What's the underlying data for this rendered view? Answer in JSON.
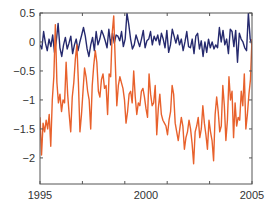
{
  "chart_data": {
    "type": "line",
    "title": "",
    "xlabel": "",
    "ylabel": "",
    "xlim": [
      1995,
      2005
    ],
    "ylim": [
      -2.45,
      0.5
    ],
    "grid": false,
    "legend": null,
    "x_ticks": [
      1995,
      1997,
      1999,
      2001,
      2003,
      2005
    ],
    "x_tick_labels": [
      "1995",
      "",
      "",
      "",
      "",
      "2005"
    ],
    "x_tick_labels_shown": [
      {
        "value": 1995,
        "label": "1995"
      },
      {
        "value": 2000,
        "label": "2000"
      },
      {
        "value": 2005,
        "label": "2005"
      }
    ],
    "y_ticks": [
      0.5,
      0,
      -0.5,
      -1,
      -1.5,
      -2
    ],
    "y_tick_labels": [
      "0.5",
      "0",
      "−0.5",
      "−1",
      "−1.5",
      "−2"
    ],
    "x_start": 1995.0,
    "x_step": 0.0833,
    "series": [
      {
        "name": "series-1",
        "color": "#262a6e",
        "values": [
          -0.05,
          -0.12,
          0.18,
          -0.02,
          -0.15,
          0.05,
          -0.08,
          0.12,
          -0.18,
          0.02,
          0.32,
          -0.1,
          -0.25,
          -0.05,
          0.08,
          -0.12,
          -0.02,
          0.1,
          -0.2,
          -0.05,
          0.05,
          -0.15,
          0.0,
          0.12,
          0.25,
          0.1,
          -0.12,
          -0.25,
          -0.05,
          0.08,
          -0.15,
          0.18,
          -0.05,
          0.05,
          0.2,
          0.12,
          0.02,
          -0.1,
          0.22,
          -0.05,
          0.15,
          -0.02,
          0.12,
          0.1,
          0.02,
          0.18,
          -0.08,
          0.05,
          0.5,
          0.3,
          0.05,
          -0.12,
          -0.05,
          0.12,
          0.02,
          -0.08,
          0.05,
          0.2,
          -0.1,
          0.02,
          0.05,
          0.18,
          -0.05,
          0.1,
          0.02,
          0.12,
          -0.05,
          0.15,
          0.05,
          -0.1,
          0.2,
          -0.18,
          -0.05,
          0.22,
          0.1,
          -0.02,
          0.12,
          -0.05,
          0.05,
          -0.15,
          0.0,
          0.18,
          -0.08,
          -0.1,
          0.05,
          -0.2,
          0.1,
          0.15,
          -0.12,
          0.02,
          -0.25,
          0.0,
          -0.18,
          0.05,
          -0.1,
          0.0,
          -0.12,
          -0.05,
          -0.1,
          0.25,
          0.0,
          0.2,
          -0.05,
          0.05,
          -0.2,
          0.22,
          0.18,
          -0.08,
          0.2,
          -0.35,
          0.15,
          0.05,
          0.0,
          -0.1,
          -0.15,
          0.5,
          0.05,
          -0.05
        ]
      },
      {
        "name": "series-2",
        "color": "#e8612c",
        "values": [
          -1.3,
          -1.95,
          -1.4,
          -1.55,
          -1.35,
          -1.5,
          -1.25,
          -1.8,
          -1.0,
          -0.6,
          0.3,
          -0.7,
          -1.05,
          -0.9,
          -1.2,
          -1.0,
          -1.05,
          -0.35,
          -0.9,
          -1.25,
          -1.55,
          -0.95,
          -0.7,
          -0.3,
          -0.05,
          -0.7,
          -1.55,
          -1.25,
          -0.85,
          -0.45,
          -0.6,
          -0.85,
          -1.0,
          -1.5,
          -0.75,
          -0.4,
          -0.15,
          -0.35,
          -0.85,
          -0.95,
          -0.65,
          -0.55,
          -0.8,
          -0.75,
          -1.25,
          -0.55,
          -0.6,
          0.15,
          0.45,
          -0.35,
          -1.1,
          -0.75,
          -0.6,
          -0.7,
          -0.8,
          -1.0,
          -1.4,
          -1.2,
          -0.9,
          -0.85,
          -1.05,
          -0.5,
          -0.95,
          -1.25,
          -1.05,
          -1.1,
          -0.85,
          -0.8,
          -0.95,
          -1.15,
          -1.3,
          -0.55,
          -0.9,
          -1.1,
          -1.05,
          -0.75,
          -1.6,
          -1.15,
          -0.9,
          -1.25,
          -1.35,
          -1.4,
          -1.45,
          -1.6,
          -1.35,
          -1.2,
          -0.75,
          -0.9,
          -1.4,
          -1.55,
          -1.7,
          -1.5,
          -1.3,
          -1.45,
          -1.85,
          -1.65,
          -1.55,
          -1.35,
          -1.5,
          -1.75,
          -2.1,
          -1.55,
          -1.45,
          -1.3,
          -1.65,
          -1.5,
          -1.1,
          -1.4,
          -1.6,
          -1.85,
          -1.35,
          -1.55,
          -1.7,
          -2.05,
          -1.25,
          -0.95,
          -1.2,
          -1.55,
          -1.45,
          -0.75,
          -1.1,
          -1.7,
          -1.35,
          -0.6,
          -1.0,
          -0.85,
          -1.65,
          -1.05,
          -1.45,
          -1.3,
          -1.35,
          -0.85,
          -1.1,
          -0.55,
          -1.5,
          -1.25,
          -0.9,
          -0.65,
          0.05
        ]
      }
    ]
  },
  "plot": {
    "background": "#ffffff",
    "axis_color": "#555555"
  }
}
